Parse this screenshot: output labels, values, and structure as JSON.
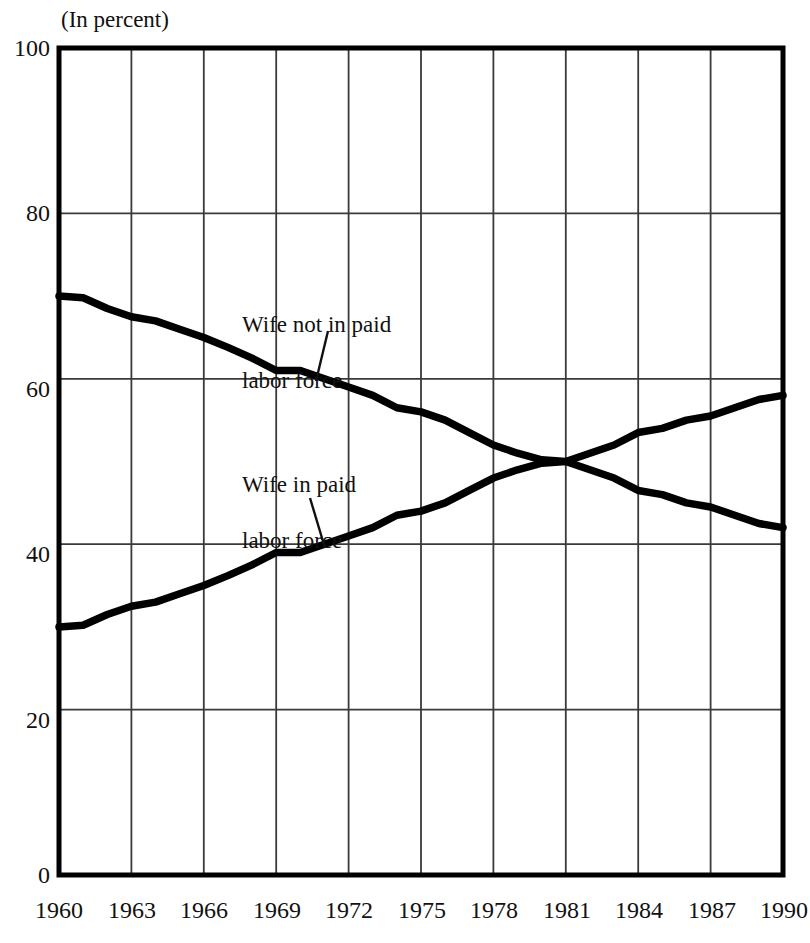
{
  "chart_data": {
    "type": "line",
    "title": "",
    "subtitle": "(In percent)",
    "xlabel": "",
    "ylabel": "",
    "unit_note": "(In percent)",
    "grid": true,
    "legend_position": "inline-annotations",
    "xlim": [
      1960,
      1990
    ],
    "ylim": [
      0,
      100
    ],
    "yticks": [
      0,
      20,
      40,
      60,
      80,
      100
    ],
    "xticks": [
      1960,
      1963,
      1966,
      1969,
      1972,
      1975,
      1978,
      1981,
      1984,
      1987,
      1990
    ],
    "x": [
      1960,
      1961,
      1962,
      1963,
      1964,
      1965,
      1966,
      1967,
      1968,
      1969,
      1970,
      1971,
      1972,
      1973,
      1974,
      1975,
      1976,
      1977,
      1978,
      1979,
      1980,
      1981,
      1982,
      1983,
      1984,
      1985,
      1986,
      1987,
      1988,
      1989,
      1990
    ],
    "series": [
      {
        "name": "Wife not in paid labor force",
        "color": "#000000",
        "values": [
          70.0,
          69.8,
          68.5,
          67.5,
          67.0,
          66.0,
          65.0,
          63.8,
          62.5,
          61.0,
          61.0,
          60.0,
          59.0,
          58.0,
          56.5,
          56.0,
          55.0,
          53.5,
          52.0,
          51.0,
          50.2,
          50.0,
          49.0,
          48.0,
          46.5,
          46.0,
          45.0,
          44.5,
          43.5,
          42.5,
          42.0
        ]
      },
      {
        "name": "Wife in paid labor force",
        "color": "#000000",
        "values": [
          30.0,
          30.2,
          31.5,
          32.5,
          33.0,
          34.0,
          35.0,
          36.2,
          37.5,
          39.0,
          39.0,
          40.0,
          41.0,
          42.0,
          43.5,
          44.0,
          45.0,
          46.5,
          48.0,
          49.0,
          49.8,
          50.0,
          51.0,
          52.0,
          53.5,
          54.0,
          55.0,
          55.5,
          56.5,
          57.5,
          58.0
        ]
      }
    ],
    "annotations": [
      {
        "text": "Wife not in paid\nlabor force",
        "target_series": "Wife not in paid labor force",
        "x": 1971,
        "y": 60
      },
      {
        "text": "Wife in paid\nlabor force",
        "target_series": "Wife in paid labor force",
        "x": 1971,
        "y": 41
      }
    ]
  },
  "axes": {
    "y_labels": [
      "100",
      "80",
      "60",
      "40",
      "20",
      "0"
    ],
    "x_labels": [
      "1960",
      "1963",
      "1966",
      "1969",
      "1972",
      "1975",
      "1978",
      "1981",
      "1984",
      "1987",
      "1990"
    ]
  },
  "annotations": {
    "upper": {
      "line1": "Wife not in paid",
      "line2": "labor force"
    },
    "lower": {
      "line1": "Wife in paid",
      "line2": "labor force"
    }
  },
  "colors": {
    "line": "#000000",
    "grid": "#3a3a3a",
    "frame": "#000000",
    "text": "#111111"
  }
}
